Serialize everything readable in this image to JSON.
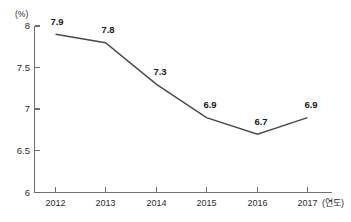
{
  "chart_data": {
    "type": "line",
    "title": "",
    "subtitle": "",
    "xlabel": "(연도)",
    "ylabel": "(%)",
    "unit_label": "(%)",
    "x_axis_suffix": "(연도)",
    "categories": [
      "2012",
      "2013",
      "2014",
      "2015",
      "2016",
      "2017"
    ],
    "values": [
      7.9,
      7.8,
      7.3,
      6.9,
      6.7,
      6.9
    ],
    "point_labels": [
      "7.9",
      "7.8",
      "7.3",
      "6.9",
      "6.7",
      "6.9"
    ],
    "series": [
      {
        "name": "",
        "values": [
          7.9,
          7.8,
          7.3,
          6.9,
          6.7,
          6.9
        ],
        "color": "#4a4a4a"
      }
    ],
    "ylim": [
      6,
      8
    ],
    "y_ticks": [
      6,
      6.5,
      7,
      7.5,
      8
    ],
    "y_tick_labels": [
      "6",
      "6.5",
      "7",
      "7.5",
      "8"
    ],
    "x_tick_labels": [
      "2012",
      "2013",
      "2014",
      "2015",
      "2016",
      "2017"
    ],
    "grid": false,
    "legend": false,
    "legend_position": "none",
    "line_color": "#4a4a4a",
    "axis_color": "#6e6e6e",
    "background_color": "#ffffff"
  }
}
